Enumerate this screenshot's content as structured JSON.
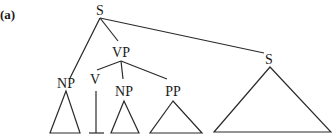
{
  "figure": {
    "panel_label": "(a)",
    "nodes": {
      "root": "S",
      "np_subject": "NP",
      "vp": "VP",
      "v": "V",
      "np_object": "NP",
      "pp": "PP",
      "s_embedded": "S"
    },
    "edges": [
      [
        "S",
        "NP"
      ],
      [
        "S",
        "VP"
      ],
      [
        "S",
        "S"
      ],
      [
        "VP",
        "V"
      ],
      [
        "VP",
        "NP"
      ],
      [
        "VP",
        "PP"
      ]
    ],
    "leaf_shapes": {
      "np_subject": "triangle",
      "v": "inverted-T",
      "np_object": "triangle",
      "pp": "triangle",
      "s_embedded": "triangle"
    }
  }
}
